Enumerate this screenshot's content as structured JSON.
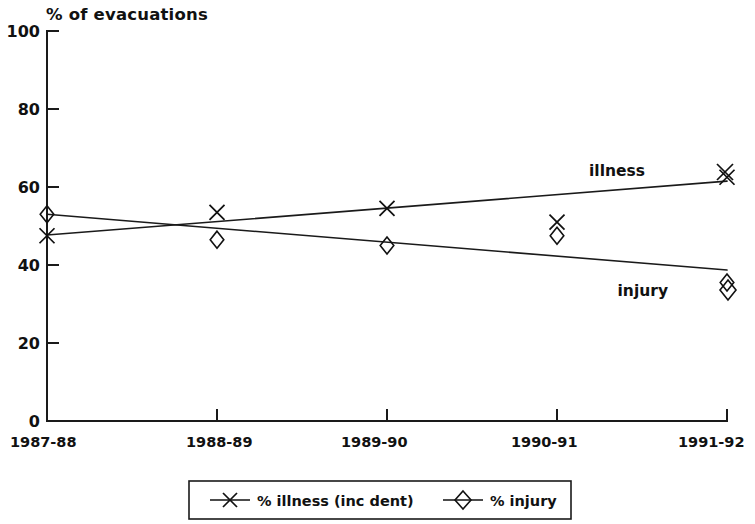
{
  "chart_data": {
    "type": "line",
    "title": "% of evacuations",
    "xlabel": "",
    "ylabel": "% of evacuations",
    "categories": [
      "1987-88",
      "1988-89",
      "1989-90",
      "1990-91",
      "1991-92"
    ],
    "ylim": [
      0,
      100
    ],
    "yticks": [
      0,
      20,
      40,
      60,
      80,
      100
    ],
    "ytick_labels": [
      "0",
      "20",
      "40",
      "60",
      "80",
      "100"
    ],
    "grid": false,
    "legend_position": "bottom-center",
    "series": [
      {
        "name": "% illness (inc dent)",
        "short_label": "illness",
        "marker": "x",
        "values": [
          47.5,
          53.5,
          54.5,
          51.0,
          62.5
        ],
        "trend_start": 47.7,
        "trend_end": 61.5
      },
      {
        "name": "% injury",
        "short_label": "injury",
        "marker": "diamond",
        "values": [
          53.0,
          46.5,
          45.0,
          47.5,
          35.5
        ],
        "trend_start": 53.0,
        "trend_end": 38.7
      }
    ],
    "annotations": [
      {
        "text": "illness",
        "series": "% illness (inc dent)",
        "x_px": 645,
        "y_px": 172
      },
      {
        "text": "injury",
        "series": "% injury",
        "x_px": 668,
        "y_px": 292
      }
    ]
  },
  "legend": {
    "items": [
      {
        "label": "% illness (inc dent)",
        "marker": "x-marker-icon"
      },
      {
        "label": "% injury",
        "marker": "diamond-marker-icon"
      }
    ]
  },
  "colors": {
    "ink": "#111111",
    "axis": "#1a1a1a",
    "background": "#ffffff"
  }
}
